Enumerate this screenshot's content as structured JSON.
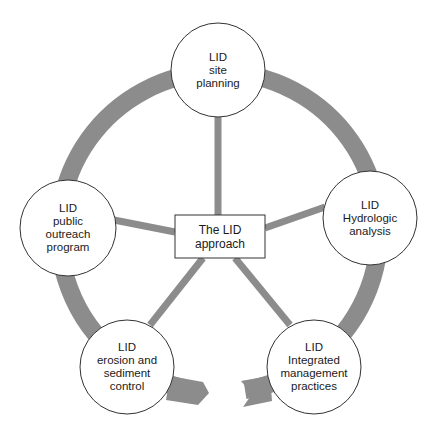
{
  "diagram": {
    "title": "The LID approach",
    "colors": {
      "ring": "#8c8c8c",
      "spoke": "#8c8c8c",
      "node_fill": "#ffffff",
      "node_stroke": "#333333",
      "text": "#1a1a1a"
    },
    "center": {
      "lines": [
        "The LID",
        "approach"
      ]
    },
    "nodes": [
      {
        "id": "site-planning",
        "lines": [
          "LID",
          "site",
          "planning"
        ]
      },
      {
        "id": "hydrologic-analysis",
        "lines": [
          "LID",
          "Hydrologic",
          "analysis"
        ]
      },
      {
        "id": "integrated-management",
        "lines": [
          "LID",
          "Integrated",
          "management",
          "practices"
        ]
      },
      {
        "id": "erosion-sediment",
        "lines": [
          "LID",
          "erosion and",
          "sediment",
          "control"
        ]
      },
      {
        "id": "public-outreach",
        "lines": [
          "LID",
          "public",
          "outreach",
          "program"
        ]
      }
    ],
    "cycle_arrow": {
      "direction": "clockwise",
      "description": "Grey ring arrow connecting nodes in a cycle, with the arrowhead near the erosion-and-sediment node and the notched tail near the integrated-management node"
    }
  }
}
